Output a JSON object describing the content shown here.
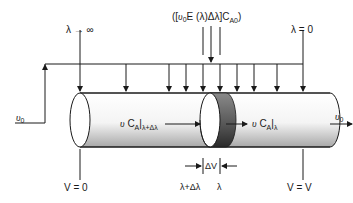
{
  "diagram": {
    "labels": {
      "lambda_infinity": "λ → ∞",
      "lambda_zero": "λ = 0",
      "feed_term": {
        "open": "([",
        "v0_symbol": "υ",
        "v0_sub": "0",
        "rest": "E (λ)Δλ]C",
        "sub": "A0",
        "close": ")"
      },
      "v0_left": {
        "symbol": "υ",
        "sub": "0"
      },
      "v0_right": {
        "symbol": "υ",
        "sub": "0"
      },
      "flow_in": {
        "symbol": "υ",
        "text": "C",
        "sub": "A",
        "bar_sub": "λ+Δλ"
      },
      "flow_out": {
        "symbol": "υ",
        "text": "C",
        "sub": "A",
        "bar_sub": "λ"
      },
      "delta_v": "ΔV",
      "lambda_plus": "λ+Δλ",
      "lambda": "λ",
      "v_start": "V = 0",
      "v_end": "V = V"
    },
    "colors": {
      "line": "#1a1a1a",
      "tube_light": "#ffffff",
      "tube_shade": "#b8b8b8",
      "slice_dark": "#3a3a3a",
      "slice_mid": "#7a7a7a"
    }
  }
}
